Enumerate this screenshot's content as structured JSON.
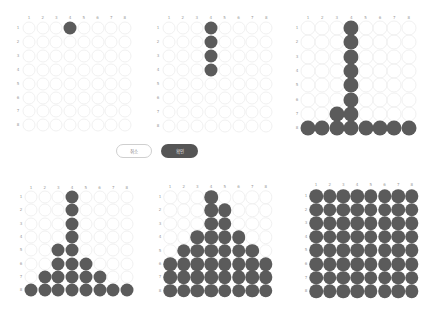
{
  "buttons": {
    "cancel_label": "취소",
    "confirm_label": "확인"
  },
  "colors": {
    "filled": "#5b5b5b",
    "empty_outline": "#f1f1f1",
    "label": "#9a9a9a",
    "confirm_bg": "#555555",
    "cancel_border": "#cfcfcf"
  },
  "grid": {
    "columns": [
      "1",
      "2",
      "3",
      "4",
      "5",
      "6",
      "7",
      "8"
    ],
    "rows": [
      "1",
      "2",
      "3",
      "4",
      "5",
      "6",
      "7",
      "8"
    ]
  },
  "boards": [
    {
      "name": "board-1",
      "origin": {
        "x": 29,
        "y": 28
      },
      "step_x": 13.7,
      "step_y": 13.9,
      "label_y": 18,
      "label_x": 18,
      "diameter": 13,
      "filled": [
        [
          1,
          4
        ]
      ]
    },
    {
      "name": "board-2",
      "origin": {
        "x": 169,
        "y": 28
      },
      "step_x": 13.9,
      "step_y": 14.0,
      "label_y": 18,
      "label_x": 158,
      "diameter": 13,
      "filled": [
        [
          1,
          4
        ],
        [
          2,
          4
        ],
        [
          3,
          4
        ],
        [
          4,
          4
        ]
      ]
    },
    {
      "name": "board-3",
      "origin": {
        "x": 308,
        "y": 28
      },
      "step_x": 14.4,
      "step_y": 14.3,
      "label_y": 18,
      "label_x": 297,
      "diameter": 15,
      "filled": [
        [
          1,
          4
        ],
        [
          2,
          4
        ],
        [
          3,
          4
        ],
        [
          4,
          4
        ],
        [
          5,
          4
        ],
        [
          6,
          4
        ],
        [
          7,
          3
        ],
        [
          7,
          4
        ],
        [
          8,
          1
        ],
        [
          8,
          2
        ],
        [
          8,
          3
        ],
        [
          8,
          4
        ],
        [
          8,
          5
        ],
        [
          8,
          6
        ],
        [
          8,
          7
        ],
        [
          8,
          8
        ]
      ]
    },
    {
      "name": "board-4",
      "origin": {
        "x": 31,
        "y": 197
      },
      "step_x": 13.7,
      "step_y": 13.3,
      "label_y": 188,
      "label_x": 21,
      "diameter": 13,
      "filled": [
        [
          1,
          4
        ],
        [
          2,
          4
        ],
        [
          3,
          4
        ],
        [
          4,
          4
        ],
        [
          5,
          3
        ],
        [
          5,
          4
        ],
        [
          6,
          3
        ],
        [
          6,
          4
        ],
        [
          6,
          5
        ],
        [
          7,
          2
        ],
        [
          7,
          3
        ],
        [
          7,
          4
        ],
        [
          7,
          5
        ],
        [
          7,
          6
        ],
        [
          8,
          1
        ],
        [
          8,
          2
        ],
        [
          8,
          3
        ],
        [
          8,
          4
        ],
        [
          8,
          5
        ],
        [
          8,
          6
        ],
        [
          8,
          7
        ],
        [
          8,
          8
        ]
      ]
    },
    {
      "name": "board-5",
      "origin": {
        "x": 170,
        "y": 197
      },
      "step_x": 13.7,
      "step_y": 13.4,
      "label_y": 187,
      "label_x": 160,
      "diameter": 13.5,
      "filled": [
        [
          1,
          4
        ],
        [
          2,
          4
        ],
        [
          2,
          5
        ],
        [
          3,
          4
        ],
        [
          3,
          5
        ],
        [
          4,
          3
        ],
        [
          4,
          4
        ],
        [
          4,
          5
        ],
        [
          4,
          6
        ],
        [
          5,
          2
        ],
        [
          5,
          3
        ],
        [
          5,
          4
        ],
        [
          5,
          5
        ],
        [
          5,
          6
        ],
        [
          5,
          7
        ],
        [
          6,
          1
        ],
        [
          6,
          2
        ],
        [
          6,
          3
        ],
        [
          6,
          4
        ],
        [
          6,
          5
        ],
        [
          6,
          6
        ],
        [
          6,
          7
        ],
        [
          6,
          8
        ],
        [
          7,
          1
        ],
        [
          7,
          2
        ],
        [
          7,
          3
        ],
        [
          7,
          4
        ],
        [
          7,
          5
        ],
        [
          7,
          6
        ],
        [
          7,
          7
        ],
        [
          7,
          8
        ],
        [
          8,
          1
        ],
        [
          8,
          2
        ],
        [
          8,
          3
        ],
        [
          8,
          4
        ],
        [
          8,
          5
        ],
        [
          8,
          6
        ],
        [
          8,
          7
        ],
        [
          8,
          8
        ]
      ]
    },
    {
      "name": "board-6",
      "origin": {
        "x": 316,
        "y": 196
      },
      "step_x": 13.7,
      "step_y": 13.6,
      "label_y": 185,
      "label_x": 306,
      "diameter": 13.5,
      "filled": "all"
    }
  ]
}
